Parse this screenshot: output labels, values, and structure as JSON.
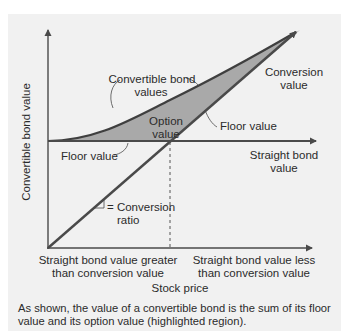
{
  "diagram": {
    "y_axis_label": "Convertible bond value",
    "x_axis_label": "Stock price",
    "labels": {
      "convertible_bond_values_line1": "Convertible bond",
      "convertible_bond_values_line2": "values",
      "conversion_value_line1": "Conversion",
      "conversion_value_line2": "value",
      "option_value_line1": "Option",
      "option_value_line2": "value",
      "floor_value_right": "Floor value",
      "floor_value_left": "Floor value",
      "straight_bond_value_line1": "Straight bond",
      "straight_bond_value_line2": "value",
      "conversion_ratio_prefix": "= Conversion",
      "conversion_ratio_line2": "ratio"
    },
    "regions": {
      "left_line1": "Straight bond value greater",
      "left_line2": "than conversion value",
      "right_line1": "Straight bond value less",
      "right_line2": "than conversion value"
    },
    "colors": {
      "panel_background": "#f1f1f1",
      "line": "#4a4a4a",
      "option_region_fill": "#aaaaaa"
    }
  },
  "caption": "As shown, the value of a convertible bond is the sum of its floor value and its option value (highlighted region)."
}
